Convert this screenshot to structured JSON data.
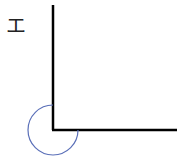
{
  "diagram": {
    "label": "エ",
    "vertex": {
      "x": 53,
      "y": 130
    },
    "vertical_ray_end": {
      "x": 53,
      "y": 5
    },
    "horizontal_ray_end": {
      "x": 177,
      "y": 130
    },
    "arc": {
      "radius": 25,
      "degrees": 270,
      "color": "#5a6fb8"
    },
    "line_color": "#000000"
  }
}
